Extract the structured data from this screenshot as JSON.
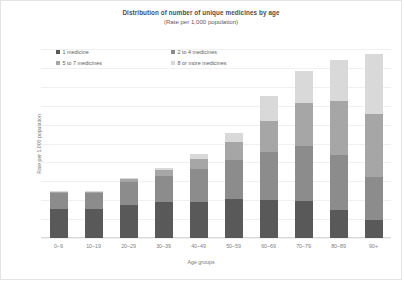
{
  "chart_data": {
    "type": "bar",
    "stacked": true,
    "title": "Distribution of number of unique medicines by age",
    "subtitle": "(Rate per 1,000 population)",
    "xlabel": "Age groups",
    "ylabel": "Rate per 1,000 population",
    "ylim": [
      0,
      1000
    ],
    "ytick_labels": [
      "0",
      "100",
      "200",
      "300",
      "400",
      "500",
      "600",
      "700",
      "800",
      "900",
      "1,000"
    ],
    "ytick_values": [
      0,
      100,
      200,
      300,
      400,
      500,
      600,
      700,
      800,
      900,
      1000
    ],
    "grid": true,
    "legend_position": "top-left",
    "categories": [
      "0–9",
      "10–19",
      "20–29",
      "30–39",
      "40–49",
      "50–59",
      "60–69",
      "70–79",
      "80–89",
      "90+"
    ],
    "series": [
      {
        "name": "1 medicine",
        "color": "#595959",
        "values": [
          155,
          152,
          175,
          190,
          190,
          205,
          200,
          195,
          150,
          95
        ]
      },
      {
        "name": "2 to 4 medicines",
        "color": "#8c8c8c",
        "values": [
          85,
          85,
          120,
          140,
          175,
          210,
          255,
          290,
          290,
          230
        ]
      },
      {
        "name": "5 to 7 medicines",
        "color": "#a6a6a6",
        "values": [
          5,
          8,
          18,
          30,
          55,
          95,
          165,
          230,
          285,
          330
        ]
      },
      {
        "name": "8 or more medicines",
        "color": "#d9d9d9",
        "values": [
          2,
          3,
          7,
          12,
          25,
          45,
          130,
          170,
          215,
          320
        ]
      }
    ]
  }
}
